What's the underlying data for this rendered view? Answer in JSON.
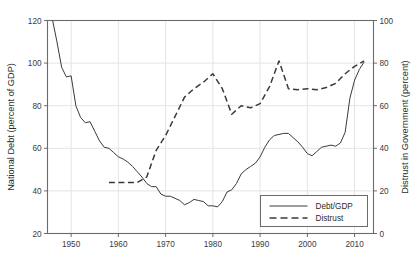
{
  "chart_data": {
    "type": "line",
    "title": "",
    "xlabel": "",
    "ylabel": "National Debt (percent of GDP)",
    "y2label": "Distrust in Government (percent)",
    "xlim": [
      1945,
      2014
    ],
    "ylim": [
      20,
      120
    ],
    "y2lim": [
      0,
      100
    ],
    "xticks": [
      1950,
      1960,
      1970,
      1980,
      1990,
      2000,
      2010
    ],
    "xticklabels": [
      "1950",
      "1960",
      "1970",
      "1980",
      "1990",
      "2000",
      "2010"
    ],
    "yticks": [
      20,
      40,
      60,
      80,
      100,
      120
    ],
    "yticklabels": [
      "20",
      "40",
      "60",
      "80",
      "100",
      "120"
    ],
    "y2ticks": [
      0,
      20,
      40,
      60,
      80,
      100
    ],
    "y2ticklabels": [
      "0",
      "20",
      "40",
      "60",
      "80",
      "100"
    ],
    "grid": "vertical-only",
    "legend_position": "lower-right",
    "series": [
      {
        "name": "Debt/GDP",
        "axis": "left",
        "style": "solid",
        "color": "#3a3a3a",
        "x": [
          1946,
          1947,
          1948,
          1949,
          1950,
          1951,
          1952,
          1953,
          1954,
          1955,
          1956,
          1957,
          1958,
          1959,
          1960,
          1961,
          1962,
          1963,
          1964,
          1965,
          1966,
          1967,
          1968,
          1969,
          1970,
          1971,
          1972,
          1973,
          1974,
          1975,
          1976,
          1977,
          1978,
          1979,
          1980,
          1981,
          1982,
          1983,
          1984,
          1985,
          1986,
          1987,
          1988,
          1989,
          1990,
          1991,
          1992,
          1993,
          1994,
          1995,
          1996,
          1997,
          1998,
          1999,
          2000,
          2001,
          2002,
          2003,
          2004,
          2005,
          2006,
          2007,
          2008,
          2009,
          2010,
          2011,
          2012
        ],
        "y": [
          121.0,
          110.0,
          98.0,
          93.5,
          94.0,
          80.0,
          74.5,
          72.0,
          72.5,
          68.0,
          63.5,
          60.5,
          60.0,
          58.0,
          56.0,
          55.0,
          53.5,
          51.5,
          49.0,
          46.5,
          43.5,
          42.0,
          42.0,
          38.5,
          37.5,
          37.5,
          36.5,
          35.5,
          33.5,
          34.5,
          36.0,
          35.5,
          35.0,
          33.0,
          33.0,
          32.5,
          35.0,
          39.5,
          40.5,
          43.5,
          48.0,
          50.0,
          51.5,
          53.0,
          56.0,
          60.5,
          64.0,
          66.0,
          66.5,
          67.0,
          67.0,
          65.0,
          63.0,
          60.5,
          57.5,
          56.5,
          58.5,
          60.5,
          61.0,
          61.5,
          61.0,
          62.5,
          67.5,
          83.5,
          92.0,
          97.0,
          100.5
        ]
      },
      {
        "name": "Distrust",
        "axis": "right",
        "style": "dashed",
        "color": "#3a3a3a",
        "x": [
          1958,
          1964,
          1966,
          1968,
          1970,
          1972,
          1974,
          1976,
          1978,
          1980,
          1982,
          1984,
          1986,
          1988,
          1990,
          1992,
          1994,
          1996,
          1998,
          2000,
          2002,
          2004,
          2006,
          2008,
          2010,
          2012
        ],
        "y": [
          24.0,
          24.0,
          26.5,
          39.0,
          46.0,
          55.0,
          64.0,
          68.0,
          71.0,
          75.0,
          68.0,
          56.0,
          60.0,
          59.0,
          61.0,
          69.0,
          81.0,
          68.0,
          67.5,
          68.0,
          67.5,
          68.5,
          70.5,
          75.0,
          78.5,
          81.0
        ]
      }
    ]
  },
  "legend": {
    "entries": [
      {
        "label": "Debt/GDP",
        "style": "solid"
      },
      {
        "label": "Distrust",
        "style": "dashed"
      }
    ]
  }
}
